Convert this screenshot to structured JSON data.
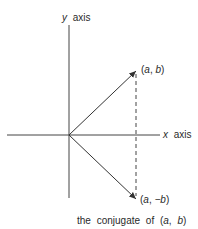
{
  "diagram": {
    "y_axis_label": {
      "var": "y",
      "word": "axis"
    },
    "x_axis_label": {
      "var": "x",
      "word": "axis"
    },
    "point_top": {
      "open": "(",
      "a": "a",
      "sep": ", ",
      "b": "b",
      "close": ")"
    },
    "point_bottom": {
      "open": "(",
      "a": "a",
      "sep": ", ",
      "b": "−b",
      "close": ")"
    },
    "caption": {
      "text": "the conjugate of ",
      "open": "(",
      "a": "a",
      "sep": ", ",
      "b": "b",
      "close": ")"
    },
    "colors": {
      "line": "#333333",
      "text": "#2a2a2a"
    }
  }
}
